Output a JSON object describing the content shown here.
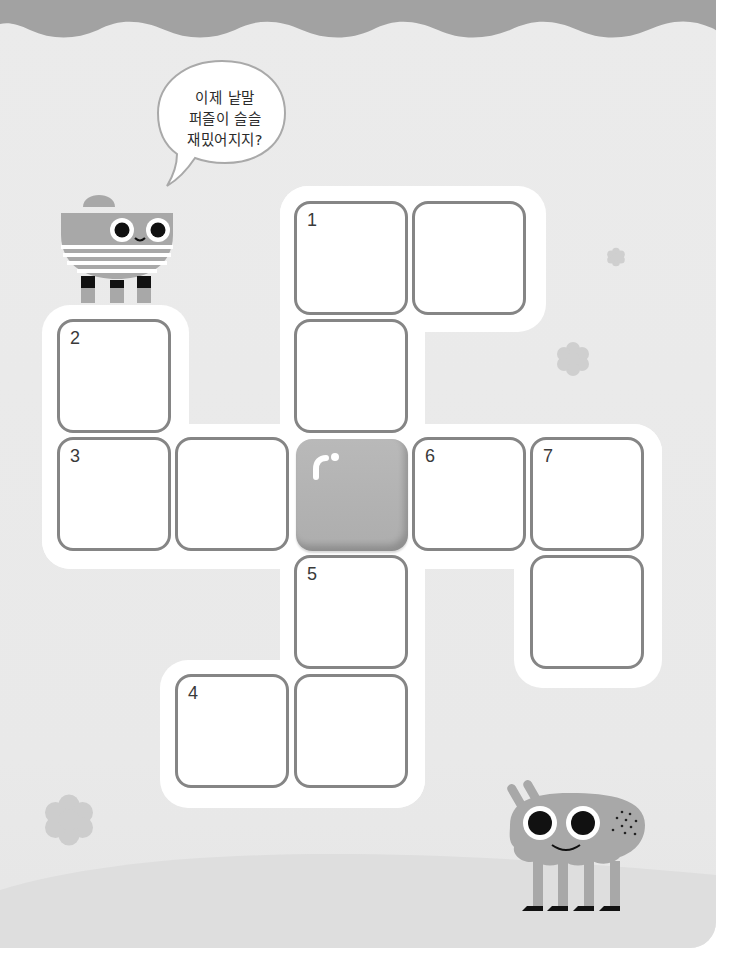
{
  "speech_bubble": {
    "lines": [
      "이제 낱말",
      "퍼즐이 슬슬",
      "재밌어지지?"
    ]
  },
  "crossword": {
    "cells": [
      {
        "id": "r0c2",
        "row": 0,
        "col": 2,
        "number": "1"
      },
      {
        "id": "r0c3",
        "row": 0,
        "col": 3,
        "number": ""
      },
      {
        "id": "r1c0",
        "row": 1,
        "col": 0,
        "number": "2"
      },
      {
        "id": "r1c2",
        "row": 1,
        "col": 2,
        "number": ""
      },
      {
        "id": "r2c0",
        "row": 2,
        "col": 0,
        "number": "3"
      },
      {
        "id": "r2c1",
        "row": 2,
        "col": 1,
        "number": ""
      },
      {
        "id": "r2c2",
        "row": 2,
        "col": 2,
        "number": "",
        "filled": true
      },
      {
        "id": "r2c3",
        "row": 2,
        "col": 3,
        "number": "6"
      },
      {
        "id": "r2c4",
        "row": 2,
        "col": 4,
        "number": "7"
      },
      {
        "id": "r3c2",
        "row": 3,
        "col": 2,
        "number": "5"
      },
      {
        "id": "r3c4",
        "row": 3,
        "col": 4,
        "number": ""
      },
      {
        "id": "r4c1",
        "row": 4,
        "col": 1,
        "number": "4"
      },
      {
        "id": "r4c2",
        "row": 4,
        "col": 2,
        "number": ""
      }
    ]
  },
  "icons": {
    "top_left_character": "striped-bowl-character-icon",
    "bottom_right_character": "four-legged-monster-icon",
    "flowers": [
      "flower-icon",
      "flower-icon",
      "flower-icon"
    ]
  },
  "colors": {
    "cell_border": "#858585",
    "page_background": "#ebebeb",
    "wave": "#9f9f9f",
    "character_gray": "#a8a8a8"
  }
}
